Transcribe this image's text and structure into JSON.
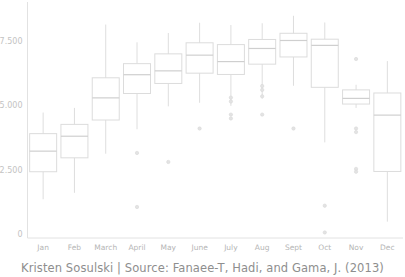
{
  "caption": "Kristen Sosulski | Source: Fanaee-T, Hadi, and Gama, J. (2013)",
  "axis": {
    "y_ticks": [
      "7.500",
      "5.000",
      "2.500",
      "0"
    ],
    "y_tick_values": [
      7500,
      5000,
      2500,
      0
    ],
    "x_labels": [
      "Jan",
      "Feb",
      "March",
      "April",
      "May",
      "June",
      "July",
      "Aug",
      "Sept",
      "Oct",
      "Nov",
      "Dec"
    ]
  },
  "colors": {
    "background": "#ffffff",
    "box_stroke": "#dcdcdc",
    "median_stroke": "#cfcfcf",
    "whisker_stroke": "#dedede",
    "outlier_fill": "#e3e3e3",
    "axis_line": "#e2e2e2",
    "tick_text": "#bdbdbd",
    "caption_text": "#8e8e8e"
  },
  "chart_data": {
    "type": "box",
    "title": "",
    "subtitle": "",
    "xlabel": "",
    "ylabel": "",
    "ylim": [
      0,
      8600
    ],
    "grid": false,
    "legend": "none",
    "categories": [
      "Jan",
      "Feb",
      "March",
      "April",
      "May",
      "June",
      "July",
      "Aug",
      "Sept",
      "Oct",
      "Nov",
      "Dec"
    ],
    "boxes": [
      {
        "category": "Jan",
        "whisker_low": 1350,
        "q1": 2420,
        "median": 3220,
        "q3": 3900,
        "whisker_high": 4720,
        "outliers": []
      },
      {
        "category": "Feb",
        "whisker_low": 1600,
        "q1": 2960,
        "median": 3800,
        "q3": 4260,
        "whisker_high": 4900,
        "outliers": []
      },
      {
        "category": "March",
        "whisker_low": 3120,
        "q1": 4430,
        "median": 5290,
        "q3": 6070,
        "whisker_high": 8140,
        "outliers": []
      },
      {
        "category": "April",
        "whisker_low": 4070,
        "q1": 5460,
        "median": 6190,
        "q3": 6620,
        "whisker_high": 7450,
        "outliers": [
          3150,
          1050
        ]
      },
      {
        "category": "May",
        "whisker_low": 4960,
        "q1": 5850,
        "median": 6340,
        "q3": 7000,
        "whisker_high": 7810,
        "outliers": [
          2800
        ]
      },
      {
        "category": "June",
        "whisker_low": 5100,
        "q1": 6250,
        "median": 6950,
        "q3": 7430,
        "whisker_high": 8210,
        "outliers": [
          4100
        ]
      },
      {
        "category": "July",
        "whisker_low": 4980,
        "q1": 6200,
        "median": 6700,
        "q3": 7360,
        "whisker_high": 8120,
        "outliers": [
          5300,
          5150,
          4640,
          4490
        ]
      },
      {
        "category": "Aug",
        "whisker_low": 5260,
        "q1": 6600,
        "median": 7210,
        "q3": 7560,
        "whisker_high": 8190,
        "outliers": [
          5750,
          5600,
          5350,
          4640
        ]
      },
      {
        "category": "Sept",
        "whisker_low": 5760,
        "q1": 6880,
        "median": 7520,
        "q3": 7800,
        "whisker_high": 8480,
        "outliers": [
          4100
        ]
      },
      {
        "category": "Oct",
        "whisker_low": 3560,
        "q1": 5700,
        "median": 7330,
        "q3": 7570,
        "whisker_high": 8220,
        "outliers": [
          1100,
          60
        ]
      },
      {
        "category": "Nov",
        "whisker_low": 4900,
        "q1": 5050,
        "median": 5270,
        "q3": 5600,
        "whisker_high": 5800,
        "outliers": [
          6800,
          4100,
          3960,
          2530,
          2420
        ]
      },
      {
        "category": "Dec",
        "whisker_low": 480,
        "q1": 2430,
        "median": 4620,
        "q3": 5480,
        "whisker_high": 6720,
        "outliers": []
      }
    ]
  }
}
